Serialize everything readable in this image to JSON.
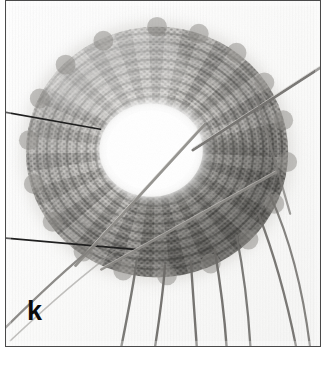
{
  "figure": {
    "panel_label": "k",
    "background_color": "#fdfdfd",
    "border_color": "#4a4a4a",
    "label_color": "#0b0b0b"
  },
  "scene": {
    "textile": {
      "name": "knitted-annulus",
      "center_x": 152,
      "center_y": 152,
      "outer_radius_x": 132,
      "outer_radius_y": 126,
      "inner_hole_center_x": 146,
      "inner_hole_center_y": 150,
      "inner_hole_radius_x": 52,
      "inner_hole_radius_y": 47,
      "rib_count": 46,
      "tone_light": "#d8d6d2",
      "tone_mid": "#8e8c88",
      "tone_dark": "#3b3a38"
    },
    "needles": [
      {
        "name": "needle-upper-left",
        "x1": -8,
        "y1": 110,
        "x2": 92,
        "y2": 128,
        "color": "#1d1d1d",
        "width": 1.7
      },
      {
        "name": "needle-lower-left",
        "x1": -8,
        "y1": 238,
        "x2": 128,
        "y2": 250,
        "color": "#1d1d1d",
        "width": 1.7
      },
      {
        "name": "needle-upper-right",
        "x1": 320,
        "y1": 68,
        "x2": 190,
        "y2": 152,
        "color": "#6d6b68",
        "width": 2.6
      },
      {
        "name": "needle-diagonal-center",
        "x1": 196,
        "y1": 128,
        "x2": 74,
        "y2": 262,
        "color": "#8f8d89",
        "width": 2.8
      },
      {
        "name": "needle-diagonal-lower",
        "x1": 268,
        "y1": 176,
        "x2": 100,
        "y2": 268,
        "color": "#8f8d89",
        "width": 2.6
      }
    ],
    "yarn_strands": [
      {
        "name": "yarn-strand-1",
        "start_x": 86,
        "start_y": 246,
        "end_x": 2,
        "end_y": 330,
        "color": "#7e7c79"
      },
      {
        "name": "yarn-strand-2",
        "start_x": 128,
        "start_y": 262,
        "end_x": 118,
        "end_y": 350,
        "color": "#6f6d6a"
      },
      {
        "name": "yarn-strand-3",
        "start_x": 156,
        "start_y": 268,
        "end_x": 152,
        "end_y": 350,
        "color": "#6a6865"
      },
      {
        "name": "yarn-strand-4",
        "start_x": 182,
        "start_y": 262,
        "end_x": 188,
        "end_y": 350,
        "color": "#6a6865"
      },
      {
        "name": "yarn-strand-5",
        "start_x": 208,
        "start_y": 252,
        "end_x": 218,
        "end_y": 350,
        "color": "#6a6865"
      },
      {
        "name": "yarn-strand-6",
        "start_x": 232,
        "start_y": 240,
        "end_x": 240,
        "end_y": 350,
        "color": "#6a6865"
      },
      {
        "name": "yarn-strand-7",
        "start_x": 252,
        "start_y": 226,
        "end_x": 282,
        "end_y": 350,
        "color": "#6a6865"
      },
      {
        "name": "yarn-strand-8",
        "start_x": 262,
        "start_y": 208,
        "end_x": 300,
        "end_y": 350,
        "color": "#6a6865"
      }
    ]
  }
}
